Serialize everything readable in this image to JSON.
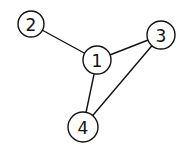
{
  "diagram": {
    "type": "undirected-graph",
    "nodes": [
      {
        "id": "1",
        "label": "1",
        "x": 97,
        "y": 60,
        "r": 14
      },
      {
        "id": "2",
        "label": "2",
        "x": 31,
        "y": 24,
        "r": 13
      },
      {
        "id": "3",
        "label": "3",
        "x": 161,
        "y": 35,
        "r": 14
      },
      {
        "id": "4",
        "label": "4",
        "x": 83,
        "y": 127,
        "r": 15
      }
    ],
    "edges": [
      {
        "from": "2",
        "to": "1"
      },
      {
        "from": "1",
        "to": "3"
      },
      {
        "from": "1",
        "to": "4"
      },
      {
        "from": "3",
        "to": "4"
      }
    ]
  }
}
